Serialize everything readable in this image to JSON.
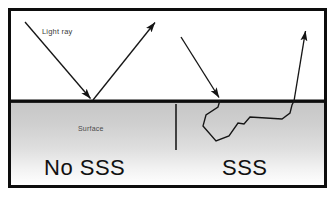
{
  "figure": {
    "kind": "diagram",
    "title_text_present": false,
    "canvas": {
      "width": 336,
      "height": 197
    },
    "frame": {
      "border_color": "#000000",
      "background_color": "#ffffff",
      "inner_background_color": "#ffffff"
    },
    "labels": {
      "light_ray": "Light ray",
      "surface": "Surface",
      "no_sss": "No SSS",
      "sss": "SSS"
    },
    "regions": {
      "above_surface": {
        "name": "air-region",
        "fill": "#ffffff"
      },
      "below_surface": {
        "name": "material-region",
        "gradient_top": "#c9c9c9",
        "gradient_bottom": "#ffffff"
      }
    },
    "surface_line": {
      "name": "surface-line",
      "color": "#000000",
      "y": 101
    },
    "divider_line": {
      "name": "panel-divider",
      "color": "#1a1a1a",
      "x": 176,
      "y_top": 104,
      "y_bottom": 150
    },
    "rays": {
      "stroke_color": "#1a1a1a",
      "left_incoming": {
        "name": "incoming-ray-left",
        "from": [
          25,
          22
        ],
        "to": [
          92,
          100
        ],
        "arrowhead": "at-end"
      },
      "left_reflected": {
        "name": "reflected-ray-left",
        "from": [
          93,
          100
        ],
        "to": [
          156,
          21
        ],
        "arrowhead": "at-end"
      },
      "right_incoming": {
        "name": "incoming-ray-right",
        "from": [
          181,
          37
        ],
        "to": [
          220,
          99
        ],
        "arrowhead": "at-end"
      },
      "right_outgoing": {
        "name": "outgoing-ray-right",
        "from": [
          294,
          101
        ],
        "to": [
          306,
          29
        ],
        "arrowhead": "at-end"
      },
      "scatter_path": {
        "name": "subsurface-scatter-path",
        "points": [
          [
            220,
            100
          ],
          [
            218,
            107
          ],
          [
            206,
            115
          ],
          [
            203,
            126
          ],
          [
            216,
            141
          ],
          [
            229,
            136
          ],
          [
            238,
            123
          ],
          [
            244,
            124
          ],
          [
            250,
            117
          ],
          [
            282,
            119
          ],
          [
            290,
            113
          ],
          [
            292,
            105
          ],
          [
            294,
            101
          ]
        ]
      }
    }
  }
}
